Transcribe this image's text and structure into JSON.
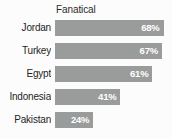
{
  "chart_data": {
    "type": "bar",
    "title": "Fanatical",
    "orientation": "horizontal",
    "xlabel": "",
    "ylabel": "",
    "xlim": [
      0,
      72
    ],
    "grid": false,
    "legend": null,
    "value_suffix": "%",
    "bar_color": "#9a9b9b",
    "value_label_color": "#ffffff",
    "category_label_color": "#1e1e1e",
    "background_color": "#fcfcfc",
    "categories": [
      "Jordan",
      "Turkey",
      "Egypt",
      "Indonesia",
      "Pakistan"
    ],
    "values": [
      68,
      67,
      61,
      41,
      24
    ],
    "points": [
      {
        "category": "Jordan",
        "value": 68,
        "value_label": "68%"
      },
      {
        "category": "Turkey",
        "value": 67,
        "value_label": "67%"
      },
      {
        "category": "Egypt",
        "value": 61,
        "value_label": "61%"
      },
      {
        "category": "Indonesia",
        "value": 41,
        "value_label": "41%"
      },
      {
        "category": "Pakistan",
        "value": 24,
        "value_label": "24%"
      }
    ]
  }
}
